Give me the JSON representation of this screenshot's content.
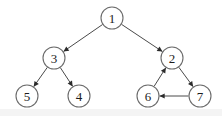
{
  "diagram": {
    "type": "directed-graph",
    "width": 222,
    "height": 116,
    "background_color": "#ffffff",
    "node_fill_color": "#ffffff",
    "node_stroke_color": "#6b6b6b",
    "edge_color": "#4a4a4a",
    "arrowhead_color": "#2b2b2b",
    "label_color": "#1c1c1c",
    "node_radius": 11,
    "nodes": [
      {
        "id": "1",
        "label": "1",
        "cx": 112,
        "cy": 18
      },
      {
        "id": "3",
        "label": "3",
        "cx": 54,
        "cy": 58
      },
      {
        "id": "2",
        "label": "2",
        "cx": 172,
        "cy": 58
      },
      {
        "id": "5",
        "label": "5",
        "cx": 27,
        "cy": 96
      },
      {
        "id": "4",
        "label": "4",
        "cx": 79,
        "cy": 96
      },
      {
        "id": "6",
        "label": "6",
        "cx": 148,
        "cy": 96
      },
      {
        "id": "7",
        "label": "7",
        "cx": 200,
        "cy": 96
      }
    ],
    "edges": [
      {
        "from": "1",
        "to": "3",
        "directed": true
      },
      {
        "from": "1",
        "to": "2",
        "directed": true
      },
      {
        "from": "3",
        "to": "5",
        "directed": true
      },
      {
        "from": "3",
        "to": "4",
        "directed": true
      },
      {
        "from": "6",
        "to": "2",
        "directed": true
      },
      {
        "from": "2",
        "to": "7",
        "directed": true
      },
      {
        "from": "7",
        "to": "6",
        "directed": true
      }
    ]
  }
}
